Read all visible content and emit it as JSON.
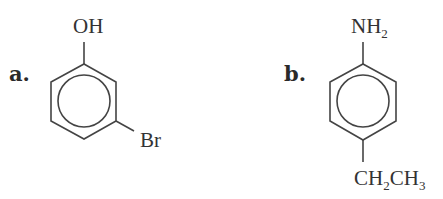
{
  "structures": [
    {
      "label": "a.",
      "name": "3-bromophenol",
      "ring": "benzene",
      "substituents": [
        {
          "position": "top",
          "text": "OH"
        },
        {
          "position": "lower-right",
          "text": "Br"
        }
      ]
    },
    {
      "label": "b.",
      "name": "4-ethylaniline",
      "ring": "benzene",
      "substituents": [
        {
          "position": "top",
          "text_main": "NH",
          "text_sub": "2"
        },
        {
          "position": "bottom",
          "parts": [
            "CH",
            "2",
            "CH",
            "3"
          ]
        }
      ]
    }
  ],
  "colors": {
    "ink": "#333333",
    "background": "#ffffff"
  }
}
